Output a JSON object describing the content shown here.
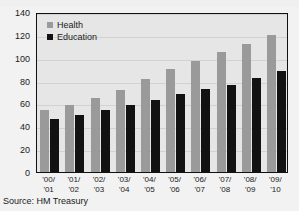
{
  "figure": {
    "background_color": "#f2f2f2",
    "plot_background_color": "#e6e6e6",
    "frame_color": "#111111"
  },
  "source_note": "Source: HM Treasury",
  "chart_data": {
    "type": "bar",
    "title": "",
    "subtitle": "",
    "xlabel": "",
    "ylabel": "",
    "ylim": [
      0,
      140
    ],
    "yticks": [
      0,
      20,
      40,
      60,
      80,
      100,
      120,
      140
    ],
    "grid": true,
    "legend_position": "top-left",
    "categories": [
      "'00/\n'01",
      "'01/\n'02",
      "'02/\n'03",
      "'03/\n'04",
      "'04/\n'05",
      "'05/\n'06",
      "'06/\n'07",
      "'07/\n'08",
      "'08/\n'09",
      "'09/\n'10"
    ],
    "category_lines": [
      [
        "'00/",
        "'01"
      ],
      [
        "'01/",
        "'02"
      ],
      [
        "'02/",
        "'03"
      ],
      [
        "'03/",
        "'04"
      ],
      [
        "'04/",
        "'05"
      ],
      [
        "'05/",
        "'06"
      ],
      [
        "'06/",
        "'07"
      ],
      [
        "'07/",
        "'08"
      ],
      [
        "'08/",
        "'09"
      ],
      [
        "'09/",
        "'10"
      ]
    ],
    "series": [
      {
        "name": "Health",
        "color": "#9a9a9a",
        "values": [
          54,
          59,
          65,
          72,
          81,
          90,
          97,
          105,
          112,
          120
        ]
      },
      {
        "name": "Education",
        "color": "#121212",
        "values": [
          46,
          50,
          54,
          59,
          63,
          68,
          73,
          76,
          82,
          88
        ]
      }
    ]
  }
}
